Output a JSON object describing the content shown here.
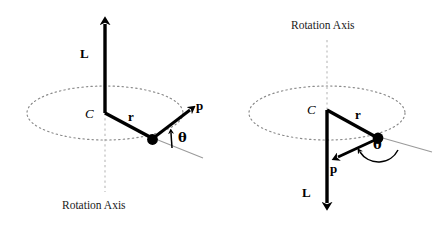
{
  "figure": {
    "background_color": "#ffffff",
    "stroke_color": "#000000",
    "axis_dash_color": "#b3b3b3",
    "orbit_dot_color": "#808080",
    "tangent_line_color": "#999999"
  },
  "panels": [
    {
      "id": "left",
      "labels": {
        "angular_momentum": "L",
        "center": "C",
        "radius": "r",
        "momentum": "p",
        "angle": "θ",
        "rotation_axis": "Rotation Axis"
      },
      "geometry": {
        "center_x": 105,
        "center_y": 113,
        "ellipse_rx": 78,
        "ellipse_ry": 27,
        "particle_x": 152,
        "particle_y": 139,
        "L_tip_y": 10,
        "L_direction": "up",
        "p_tip_x": 197,
        "p_tip_y": 105,
        "p_direction": "up-right",
        "axis_label_y": 206
      }
    },
    {
      "id": "right",
      "labels": {
        "angular_momentum": "L",
        "center": "C",
        "radius": "r",
        "momentum": "p",
        "angle": "θ",
        "rotation_axis": "Rotation Axis"
      },
      "geometry": {
        "center_x": 107,
        "center_y": 113,
        "ellipse_rx": 78,
        "ellipse_ry": 27,
        "particle_x": 158,
        "particle_y": 139,
        "L_tip_y": 216,
        "L_direction": "down",
        "p_tip_x": 112,
        "p_tip_y": 158,
        "p_direction": "down-left",
        "axis_label_y": 26
      }
    }
  ],
  "annotations": {
    "left_caption_position": "below",
    "right_caption_position": "above",
    "left_L_sense": "L points up along rotation axis",
    "right_L_sense": "L points down along rotation axis"
  }
}
